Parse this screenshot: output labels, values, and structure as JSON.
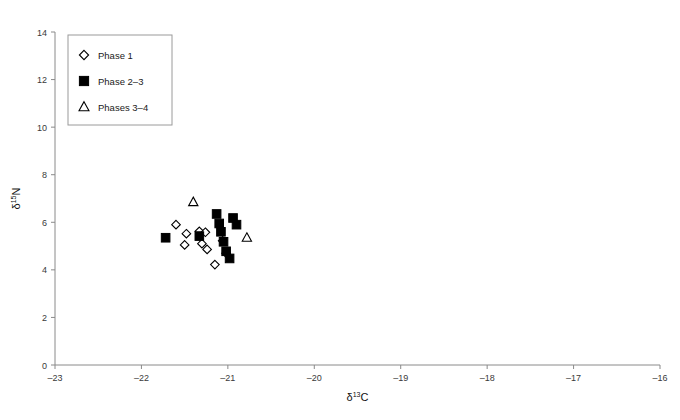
{
  "chart_data": {
    "type": "scatter",
    "title": "",
    "xlabel": "δ¹³C",
    "ylabel": "δ¹⁵N",
    "xlabel_base": "δ",
    "xlabel_sup": "13",
    "xlabel_elem": "C",
    "ylabel_base": "δ",
    "ylabel_sup": "15",
    "ylabel_elem": "N",
    "xlim": [
      -23,
      -16
    ],
    "ylim": [
      0,
      14
    ],
    "xticks": [
      -23,
      -22,
      -21,
      -20,
      -19,
      -18,
      -17,
      -16
    ],
    "yticks": [
      0,
      2,
      4,
      6,
      8,
      10,
      12,
      14
    ],
    "xtick_labels": [
      "–23",
      "–22",
      "–21",
      "–20",
      "–19",
      "–18",
      "–17",
      "–16"
    ],
    "ytick_labels": [
      "0",
      "2",
      "4",
      "6",
      "8",
      "10",
      "12",
      "14"
    ],
    "grid": false,
    "legend_position": "top-left",
    "series": [
      {
        "name": "Phase 1",
        "marker": "diamond-open",
        "color": "#000000",
        "points": [
          [
            -21.6,
            5.9
          ],
          [
            -21.48,
            5.52
          ],
          [
            -21.5,
            5.05
          ],
          [
            -21.33,
            5.62
          ],
          [
            -21.26,
            5.58
          ],
          [
            -21.3,
            5.1
          ],
          [
            -21.24,
            4.86
          ],
          [
            -21.15,
            4.22
          ],
          [
            -21.06,
            5.22
          ],
          [
            -21.02,
            4.7
          ]
        ]
      },
      {
        "name": "Phase 2–3",
        "marker": "square-filled",
        "color": "#000000",
        "points": [
          [
            -21.72,
            5.35
          ],
          [
            -21.33,
            5.42
          ],
          [
            -21.13,
            6.35
          ],
          [
            -21.1,
            5.95
          ],
          [
            -21.08,
            5.6
          ],
          [
            -21.05,
            5.18
          ],
          [
            -21.02,
            4.78
          ],
          [
            -20.98,
            4.48
          ],
          [
            -20.94,
            6.18
          ],
          [
            -20.9,
            5.9
          ]
        ]
      },
      {
        "name": "Phases 3–4",
        "marker": "triangle-open",
        "color": "#000000",
        "points": [
          [
            -21.4,
            6.85
          ],
          [
            -20.78,
            5.35
          ]
        ]
      }
    ]
  },
  "legend": {
    "items": [
      {
        "label": "Phase 1",
        "marker": "diamond-open"
      },
      {
        "label": "Phase 2–3",
        "marker": "square-filled"
      },
      {
        "label": "Phases 3–4",
        "marker": "triangle-open"
      }
    ]
  },
  "caption": {
    "text": ""
  }
}
